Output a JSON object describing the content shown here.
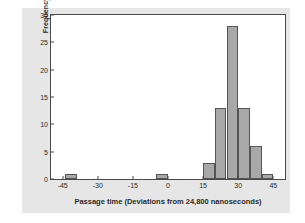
{
  "chart_data": {
    "type": "bar",
    "subtype": "histogram",
    "title": "",
    "xlabel": "Passage time (Deviations from 24,800 nanoseconds)",
    "ylabel": "Frequency",
    "xlim": [
      -50,
      50
    ],
    "ylim": [
      0,
      30
    ],
    "xticks": [
      -45,
      -30,
      -15,
      0,
      15,
      30,
      45
    ],
    "yticks": [
      0,
      5,
      10,
      15,
      20,
      25,
      30
    ],
    "xtick_labels": [
      "-45",
      "-30",
      "-15",
      "0",
      "15",
      "30",
      "45"
    ],
    "ytick_labels": [
      "0",
      "5",
      "10",
      "15",
      "20",
      "25",
      "30"
    ],
    "grid": false,
    "legend": false,
    "bin_width": 5,
    "bars": [
      {
        "bin_start": -44,
        "bin_end": -39,
        "value": 1
      },
      {
        "bin_start": -5,
        "bin_end": 0,
        "value": 1
      },
      {
        "bin_start": 15,
        "bin_end": 20,
        "value": 3
      },
      {
        "bin_start": 20,
        "bin_end": 25,
        "value": 13
      },
      {
        "bin_start": 25,
        "bin_end": 30,
        "value": 28
      },
      {
        "bin_start": 30,
        "bin_end": 35,
        "value": 13
      },
      {
        "bin_start": 35,
        "bin_end": 40,
        "value": 6
      },
      {
        "bin_start": 40,
        "bin_end": 45,
        "value": 1
      }
    ],
    "categories": [
      "-44 to -39",
      "-5 to 0",
      "15 to 20",
      "20 to 25",
      "25 to 30",
      "30 to 35",
      "35 to 40",
      "40 to 45"
    ],
    "values": [
      1,
      1,
      3,
      13,
      28,
      13,
      6,
      1
    ],
    "colors": {
      "bar_fill": "#a8a8a8",
      "bar_edge": "#555555",
      "plot_background": "#ffffff",
      "figure_background": "#e6e6e6",
      "axis": "#4a4a4a",
      "text": "#2b2b2b"
    }
  }
}
